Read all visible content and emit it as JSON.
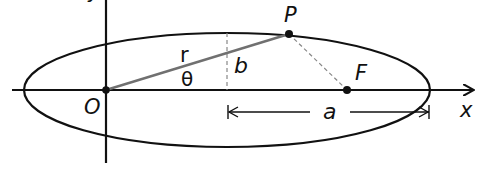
{
  "diagram": {
    "labels": {
      "y_axis": "y",
      "x_axis": "x",
      "origin": "O",
      "point": "P",
      "focus": "F",
      "radius": "r",
      "angle": "θ",
      "semi_minor": "b",
      "semi_major": "a"
    },
    "colors": {
      "ink": "#111111",
      "radius_line": "#707070",
      "dashed": "#888888"
    }
  }
}
